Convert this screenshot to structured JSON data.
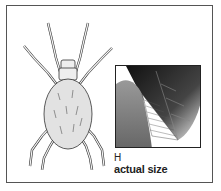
{
  "figure": {
    "inset_subject": "leaf close-up",
    "scale_mark": "H",
    "caption": "actual size"
  }
}
